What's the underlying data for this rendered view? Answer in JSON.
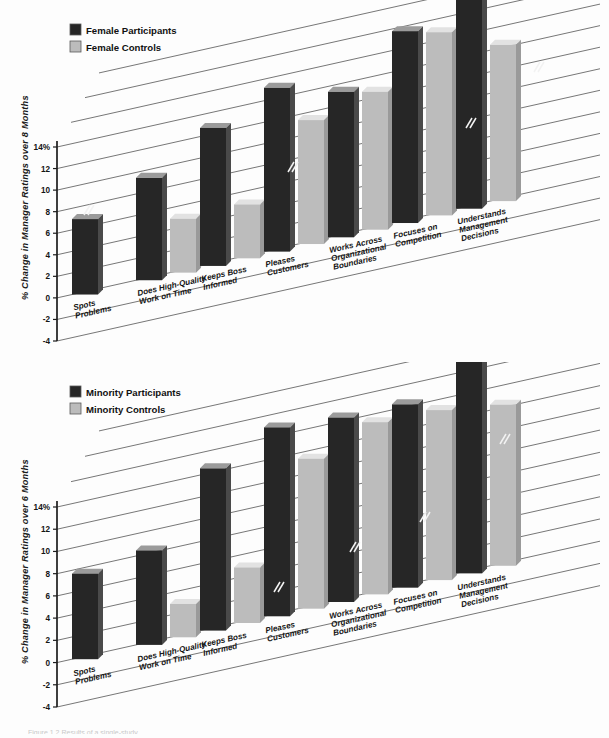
{
  "figure": {
    "background": "#fdfdfd",
    "dark_color": "#262626",
    "light_color": "#bcbcbc",
    "caption_partial": "Figure 1.2   Results of a single-study....."
  },
  "charts": [
    {
      "id": "female",
      "ylabel": "% Change in Manager Ratings over 8 Months",
      "legend": [
        {
          "label": "Female Participants",
          "color": "#262626",
          "key": "participants"
        },
        {
          "label": "Female Controls",
          "color": "#bcbcbc",
          "key": "controls"
        }
      ],
      "ticks": [
        "14%",
        "12",
        "10",
        "8",
        "6",
        "4",
        "2",
        "0",
        "-2",
        "-4"
      ],
      "chart_data": {
        "type": "bar",
        "title": "",
        "subtitle": "",
        "xlabel": "",
        "ylabel": "% Change in Manager Ratings over 8 Months",
        "ylim": [
          -4,
          14
        ],
        "ytick_values": [
          14,
          12,
          10,
          8,
          6,
          4,
          2,
          0,
          -2,
          -4
        ],
        "ytick_labels": [
          "14%",
          "12",
          "10",
          "8",
          "6",
          "4",
          "2",
          "0",
          "-2",
          "-4"
        ],
        "grid": true,
        "legend_position": "top-left",
        "categories": [
          "Spots Problems",
          "Does High-Quality Work on Time",
          "Keeps Boss Informed",
          "Pleases Customers",
          "Works Across Organizational Boundaries",
          "Focuses on Competition",
          "Understands Management Decisions"
        ],
        "series": [
          {
            "name": "Female Participants",
            "color": "#262626",
            "values": [
              7.0,
              9.5,
              12.8,
              15.2,
              13.5,
              17.8,
              21.0
            ]
          },
          {
            "name": "Female Controls",
            "color": "#bcbcbc",
            "values": [
              0.0,
              5.0,
              5.0,
              11.5,
              12.8,
              17.0,
              14.5
            ]
          }
        ]
      }
    },
    {
      "id": "minority",
      "ylabel": "% Change in Manager Ratings over 6 Months",
      "legend": [
        {
          "label": "Minority Participants",
          "color": "#262626",
          "key": "participants"
        },
        {
          "label": "Minority Controls",
          "color": "#bcbcbc",
          "key": "controls"
        }
      ],
      "ticks": [
        "14%",
        "12",
        "10",
        "8",
        "6",
        "4",
        "2",
        "0",
        "-2",
        "-4"
      ],
      "chart_data": {
        "type": "bar",
        "title": "",
        "subtitle": "",
        "xlabel": "",
        "ylabel": "% Change in Manager Ratings over 6 Months",
        "ylim": [
          -4,
          14
        ],
        "ytick_values": [
          14,
          12,
          10,
          8,
          6,
          4,
          2,
          0,
          -2,
          -4
        ],
        "ytick_labels": [
          "14%",
          "12",
          "10",
          "8",
          "6",
          "4",
          "2",
          "0",
          "-2",
          "-4"
        ],
        "grid": true,
        "legend_position": "top-left",
        "categories": [
          "Spots Problems",
          "Does High-Quality Work on Time",
          "Keeps Boss Informed",
          "Pleases Customers",
          "Works Across Organizational Boundaries",
          "Focuses on Competition",
          "Understands Management Decisions"
        ],
        "series": [
          {
            "name": "Minority Participants",
            "color": "#262626",
            "values": [
              7.7,
              8.5,
              14.6,
              17.0,
              16.6,
              16.5,
              22.5
            ]
          },
          {
            "name": "Minority Controls",
            "color": "#bcbcbc",
            "values": [
              0.0,
              3.0,
              5.0,
              13.5,
              15.5,
              15.3,
              14.5
            ]
          }
        ]
      }
    }
  ]
}
